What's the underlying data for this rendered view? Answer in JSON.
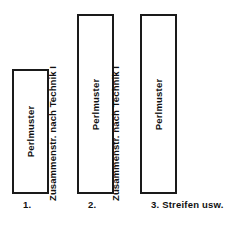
{
  "diagram": {
    "panels": [
      {
        "label": "Perlmuster",
        "caption": "1."
      },
      {
        "label": "Perlmuster",
        "caption": "2."
      },
      {
        "label": "Perlmuster",
        "caption": "3. Streifen usw."
      }
    ],
    "separators": [
      {
        "label": "Zusammenstr. nach Technik I"
      },
      {
        "label": "Zusammenstr. nach Technik I"
      }
    ],
    "colors": {
      "stroke": "#1a1a1a",
      "fill": "#ffffff",
      "text": "#111111",
      "background": "#ffffff"
    }
  }
}
